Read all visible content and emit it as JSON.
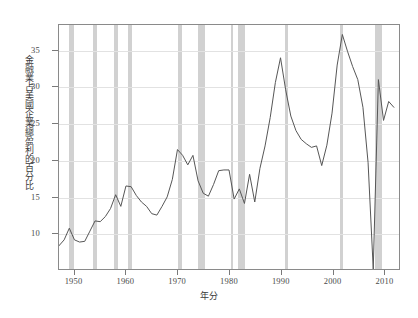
{
  "chart_data": {
    "type": "line",
    "title": "",
    "subtitle": "",
    "xlabel": "年分",
    "ylabel": "金融業占美國企業總盈利的百分比",
    "xlim": [
      1947,
      2013
    ],
    "ylim": [
      5,
      38.5
    ],
    "grid": true,
    "legend": null,
    "yticks": [
      10,
      15,
      20,
      25,
      30,
      35
    ],
    "ytick_labels": [
      "10",
      "15",
      "20",
      "25",
      "30",
      "35"
    ],
    "xticks": [
      1950,
      1960,
      1970,
      1980,
      1990,
      2000,
      2010
    ],
    "xtick_labels": [
      "1950",
      "1960",
      "1970",
      "1980",
      "1990",
      "2000",
      "2010"
    ],
    "line_color": "#555555",
    "band_color": "#c9c9c9",
    "series": [
      {
        "name": "金融業占美國企業總盈利的百分比",
        "x": [
          1947,
          1948,
          1949,
          1950,
          1951,
          1952,
          1953,
          1954,
          1955,
          1956,
          1957,
          1958,
          1959,
          1960,
          1961,
          1962,
          1963,
          1964,
          1965,
          1966,
          1967,
          1968,
          1969,
          1970,
          1971,
          1972,
          1973,
          1974,
          1975,
          1976,
          1977,
          1978,
          1979,
          1980,
          1981,
          1982,
          1983,
          1984,
          1985,
          1986,
          1987,
          1988,
          1989,
          1990,
          1991,
          1992,
          1993,
          1994,
          1995,
          1996,
          1997,
          1998,
          1999,
          2000,
          2001,
          2002,
          2003,
          2004,
          2005,
          2006,
          2007,
          2008,
          2009,
          2010,
          2011,
          2012
        ],
        "values": [
          8.2,
          9.0,
          10.6,
          9.0,
          8.7,
          8.8,
          10.2,
          11.6,
          11.5,
          12.2,
          13.3,
          15.2,
          13.6,
          16.4,
          16.3,
          15.1,
          14.2,
          13.6,
          12.6,
          12.4,
          13.6,
          14.9,
          17.3,
          21.4,
          20.6,
          19.3,
          20.6,
          17.1,
          15.4,
          15.0,
          16.6,
          18.5,
          18.6,
          18.6,
          14.6,
          16.0,
          14.0,
          18.0,
          14.2,
          18.8,
          21.9,
          25.8,
          30.6,
          34.0,
          29.6,
          26.0,
          24.0,
          22.8,
          22.2,
          21.7,
          21.9,
          19.2,
          22.0,
          26.4,
          33.0,
          37.2,
          34.9,
          32.8,
          31.0,
          27.2,
          19.6,
          5.0,
          31.0,
          25.4,
          28.0,
          27.2
        ]
      }
    ],
    "recession_bands": [
      {
        "start": 1948.9,
        "end": 1949.8
      },
      {
        "start": 1953.6,
        "end": 1954.4
      },
      {
        "start": 1957.6,
        "end": 1958.3
      },
      {
        "start": 1960.3,
        "end": 1961.1
      },
      {
        "start": 1969.9,
        "end": 1970.8
      },
      {
        "start": 1973.9,
        "end": 1975.2
      },
      {
        "start": 1980.1,
        "end": 1980.5
      },
      {
        "start": 1981.5,
        "end": 1982.9
      },
      {
        "start": 1990.6,
        "end": 1991.2
      },
      {
        "start": 2001.2,
        "end": 2001.9
      },
      {
        "start": 2007.9,
        "end": 2009.4
      }
    ]
  }
}
